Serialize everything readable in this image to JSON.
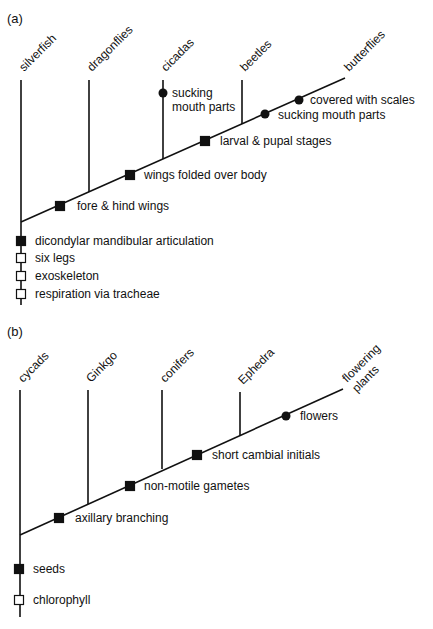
{
  "colors": {
    "line": "#111111",
    "background": "#ffffff"
  },
  "panels": [
    {
      "id": "a",
      "label": "(a)",
      "label_pos": [
        7,
        23
      ],
      "root": [
        21,
        222
      ],
      "tip_end": [
        345,
        78
      ],
      "trunk_bottom": 305,
      "taxa": [
        {
          "name": "silverfish",
          "x": 21,
          "top": 80,
          "bottom": 222,
          "label_pos": [
            24,
            72
          ]
        },
        {
          "name": "dragonflies",
          "x": 89,
          "top": 80,
          "bottom": 192,
          "label_pos": [
            92,
            72
          ]
        },
        {
          "name": "cicadas",
          "x": 163,
          "top": 80,
          "bottom": 159,
          "label_pos": [
            166,
            72
          ]
        },
        {
          "name": "beetles",
          "x": 242,
          "top": 80,
          "bottom": 124,
          "label_pos": [
            245,
            72
          ]
        },
        {
          "name": "butterflies",
          "x": 345,
          "top": 78,
          "bottom": 78,
          "label_pos": [
            349,
            72
          ]
        }
      ],
      "characters": [
        {
          "text": "fore & hind wings",
          "marker": "filled-square",
          "pos": [
            60,
            206
          ],
          "text_pos": [
            77,
            210
          ]
        },
        {
          "text": "wings folded over body",
          "marker": "filled-square",
          "pos": [
            130,
            175
          ],
          "text_pos": [
            144,
            179
          ]
        },
        {
          "text": "larval & pupal stages",
          "marker": "filled-square",
          "pos": [
            205,
            141
          ],
          "text_pos": [
            220,
            145
          ]
        },
        {
          "text": "sucking mouth parts",
          "marker": "dot",
          "pos": [
            265,
            114
          ],
          "text_pos": [
            278,
            119
          ]
        },
        {
          "text": "covered with scales",
          "marker": "dot",
          "pos": [
            299,
            100
          ],
          "text_pos": [
            310,
            104
          ]
        },
        {
          "text": "dicondylar mandibular articulation",
          "marker": "filled-square",
          "pos": [
            21,
            241
          ],
          "text_pos": [
            35,
            245
          ]
        },
        {
          "text": "six legs",
          "marker": "open-square",
          "pos": [
            21,
            258
          ],
          "text_pos": [
            35,
            262
          ]
        },
        {
          "text": "exoskeleton",
          "marker": "open-square",
          "pos": [
            21,
            276
          ],
          "text_pos": [
            35,
            280
          ]
        },
        {
          "text": "respiration via tracheae",
          "marker": "open-square",
          "pos": [
            21,
            294
          ],
          "text_pos": [
            35,
            298
          ]
        }
      ],
      "cicada_character": {
        "lines": [
          "sucking",
          "mouth parts"
        ],
        "marker": "dot",
        "pos": [
          163,
          93
        ],
        "text_pos": [
          172,
          97
        ]
      }
    },
    {
      "id": "b",
      "label": "(b)",
      "label_pos": [
        7,
        336
      ],
      "root": [
        20,
        535
      ],
      "tip_end": [
        343,
        389
      ],
      "trunk_bottom": 617,
      "taxa": [
        {
          "name": "cycads",
          "x": 20,
          "top": 390,
          "bottom": 535,
          "label_pos": [
            23,
            383
          ]
        },
        {
          "name": "Ginkgo",
          "x": 88,
          "top": 390,
          "bottom": 504,
          "label_pos": [
            91,
            383
          ]
        },
        {
          "name": "conifers",
          "x": 162,
          "top": 390,
          "bottom": 469,
          "label_pos": [
            165,
            383
          ]
        },
        {
          "name": "Ephedra",
          "x": 240,
          "top": 392,
          "bottom": 436,
          "label_pos": [
            243,
            385
          ]
        }
      ],
      "flowering_label": {
        "lines": [
          "flowering",
          "plants"
        ],
        "label_pos": [
          347,
          383
        ]
      },
      "characters": [
        {
          "text": "axillary branching",
          "marker": "filled-square",
          "pos": [
            59,
            518
          ],
          "text_pos": [
            75,
            522
          ]
        },
        {
          "text": "non-motile gametes",
          "marker": "filled-square",
          "pos": [
            130,
            486
          ],
          "text_pos": [
            144,
            490
          ]
        },
        {
          "text": "short cambial initials",
          "marker": "filled-square",
          "pos": [
            197,
            455
          ],
          "text_pos": [
            212,
            459
          ]
        },
        {
          "text": "flowers",
          "marker": "dot",
          "pos": [
            286,
            416
          ],
          "text_pos": [
            300,
            420
          ]
        },
        {
          "text": "seeds",
          "marker": "filled-square",
          "pos": [
            19,
            569
          ],
          "text_pos": [
            33,
            573
          ]
        },
        {
          "text": "chlorophyll",
          "marker": "open-square",
          "pos": [
            19,
            600
          ],
          "text_pos": [
            33,
            604
          ]
        }
      ]
    }
  ]
}
